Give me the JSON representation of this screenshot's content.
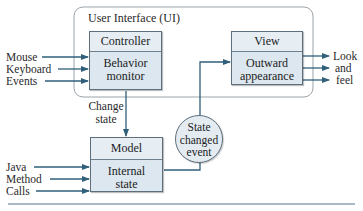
{
  "diagram": {
    "ui_container": {
      "label": "User Interface (UI)"
    },
    "controller": {
      "title": "Controller",
      "body_line1": "Behavior",
      "body_line2": "monitor"
    },
    "view": {
      "title": "View",
      "body_line1": "Outward",
      "body_line2": "appearance"
    },
    "model": {
      "title": "Model",
      "body_line1": "Internal",
      "body_line2": "state"
    },
    "event_circle": {
      "line1": "State",
      "line2": "changed",
      "line3": "event"
    },
    "controller_inputs": [
      "Mouse",
      "Keyboard",
      "Events"
    ],
    "view_outputs": [
      "Look",
      "and",
      "feel"
    ],
    "model_inputs": [
      "Java",
      "Method",
      "Calls"
    ],
    "change_state_label": {
      "line1": "Change",
      "line2": "state"
    },
    "colors": {
      "box_fill": "#dce7ef",
      "arrow": "#2f5f7a",
      "border": "#5d6f7c"
    }
  }
}
